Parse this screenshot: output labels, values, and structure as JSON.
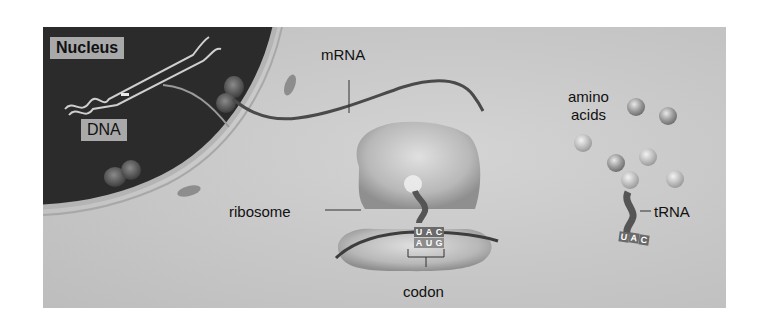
{
  "diagram": {
    "type": "protein translation illustration",
    "labels": {
      "nucleus": "Nucleus",
      "dna": "DNA",
      "mrna": "mRNA",
      "ribosome": "ribosome",
      "amino_acids_line1": "amino",
      "amino_acids_line2": "acids",
      "trna": "tRNA",
      "codon": "codon"
    },
    "ribosome_bases": {
      "anticodon": [
        "U",
        "A",
        "C"
      ],
      "codon": [
        "A",
        "U",
        "G"
      ]
    },
    "free_trna_anticodon": [
      "U",
      "A",
      "C"
    ],
    "colors": {
      "background": "#c8c8c8",
      "nucleus": "#2a2a2a",
      "nuclear_envelope": "#b0b0b0",
      "mrna_strand": "#4a4a4a",
      "label_box": "#a9a9a9",
      "base_box": "#6a6a6a"
    }
  }
}
